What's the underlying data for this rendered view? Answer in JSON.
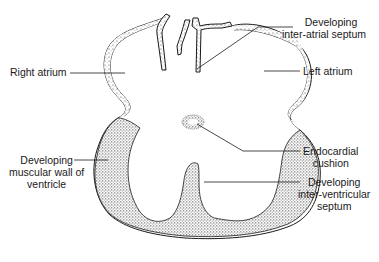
{
  "figure": {
    "labels": {
      "inter_atrial_septum": [
        "Developing",
        "inter-atrial septum"
      ],
      "right_atrium": "Right atrium",
      "left_atrium": "Left atrium",
      "endocardial_cushion": [
        "Endocardial",
        "cushion"
      ],
      "muscular_wall": [
        "Developing",
        "muscular wall of",
        "ventricle"
      ],
      "inter_ventricular_septum": [
        "Developing",
        "inter-ventricular",
        "septum"
      ]
    },
    "colors": {
      "line": "#1a1a1a",
      "stipple": "#555555",
      "background": "#ffffff"
    }
  }
}
